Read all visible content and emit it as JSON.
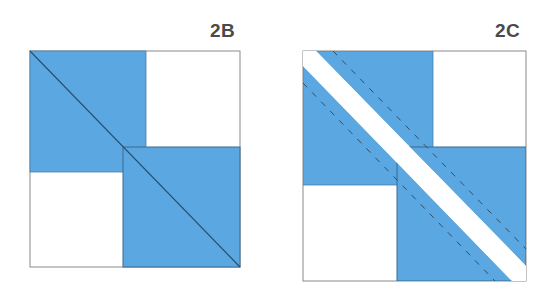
{
  "figures": [
    {
      "id": "2B",
      "label": "2B",
      "description": "Block with two blue half-square units overlapping on a shared diagonal seam line"
    },
    {
      "id": "2C",
      "label": "2C",
      "description": "Same block cut along diagonal with white strip; dashed stitching lines parallel to cut"
    }
  ],
  "colors": {
    "blue": "#5aa7e2",
    "outline": "#7a7a7a",
    "seam": "#2a4f6e",
    "stitch": "#2a4f6e",
    "background": "#ffffff",
    "label": "#4a4a4a"
  }
}
